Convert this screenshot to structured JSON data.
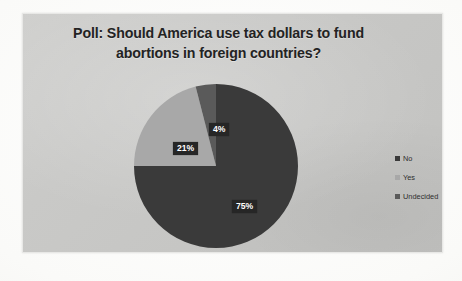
{
  "chart": {
    "title_line1": "Poll: Should America use tax dollars to fund",
    "title_line2": "abortions in foreign countries?",
    "panel_background": "#c7c7c5",
    "title_color": "#232323",
    "label_box_color": "#262626",
    "label_text_color": "#ffffff"
  },
  "legend": {
    "items": [
      {
        "label": "No",
        "color": "#3a3a3a"
      },
      {
        "label": "Yes",
        "color": "#a8a8a8"
      },
      {
        "label": "Undecided",
        "color": "#5a5a5a"
      }
    ]
  },
  "labels": {
    "no": "75%",
    "yes": "21%",
    "undecided": "4%"
  },
  "chart_data": {
    "type": "pie",
    "title": "Poll: Should America use tax dollars to fund abortions in foreign countries?",
    "categories": [
      "No",
      "Yes",
      "Undecided"
    ],
    "values": [
      75,
      21,
      4
    ],
    "value_labels": [
      "75%",
      "21%",
      "4%"
    ],
    "units": "percent",
    "colors": [
      "#3a3a3a",
      "#a8a8a8",
      "#5a5a5a"
    ],
    "start_angle_deg": 0,
    "direction": "clockwise",
    "legend": true,
    "legend_position": "right",
    "grid": false,
    "xlabel": "",
    "ylabel": ""
  }
}
